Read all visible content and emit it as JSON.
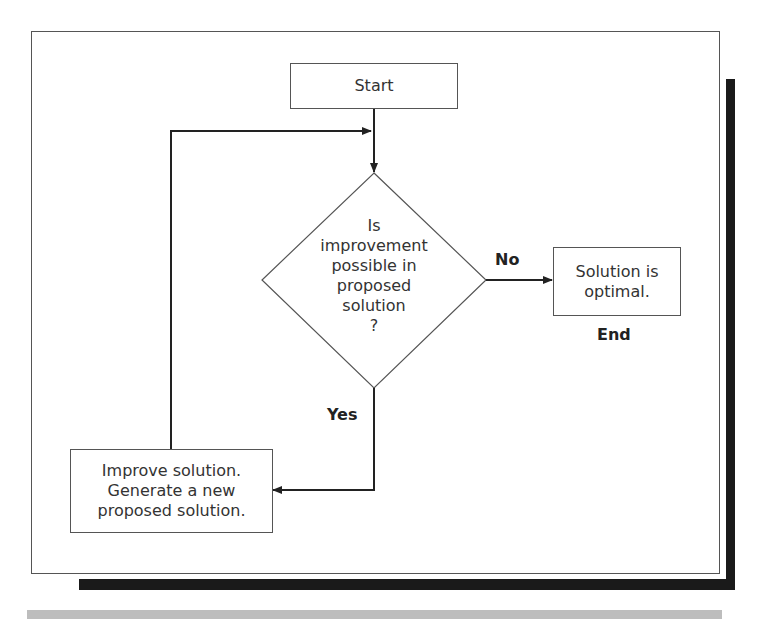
{
  "diagram": {
    "type": "flowchart",
    "nodes": {
      "start": {
        "label": "Start"
      },
      "decision": {
        "label": "Is\nimprovement\npossible in\nproposed\nsolution\n?"
      },
      "optimal": {
        "label": "Solution is\noptimal."
      },
      "improve": {
        "label": "Improve solution.\nGenerate a new\nproposed solution."
      }
    },
    "edges": {
      "no_label": "No",
      "yes_label": "Yes",
      "end_label": "End"
    },
    "colors": {
      "line": "#333333",
      "shadow": "#1a1a1a",
      "grey_bar": "#bdbdbd"
    }
  }
}
